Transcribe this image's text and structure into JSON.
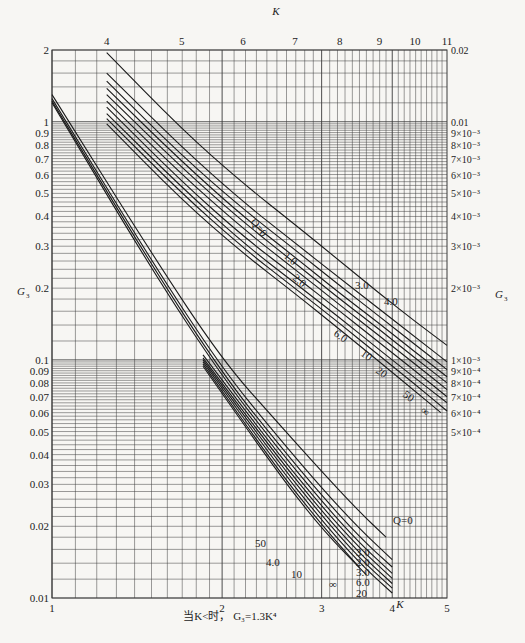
{
  "chart_data": {
    "type": "line",
    "title": "",
    "plot_area": {
      "left": 52,
      "right": 447,
      "top": 50,
      "bottom": 598
    },
    "grid": true,
    "bottom_axis": {
      "label": "K",
      "scale": "log",
      "range": [
        1,
        5
      ],
      "ticks": [
        1,
        2,
        3,
        4,
        5
      ],
      "tick_labels": [
        "1",
        "2",
        "3",
        "4",
        "5"
      ]
    },
    "top_axis": {
      "label": "K",
      "scale": "log",
      "range": [
        3.4,
        11
      ],
      "ticks": [
        4,
        5,
        6,
        7,
        8,
        9,
        10,
        11
      ],
      "tick_labels": [
        "4",
        "5",
        "6",
        "7",
        "8",
        "9",
        "10",
        "11"
      ]
    },
    "left_axis": {
      "label": "G3",
      "scale": "log",
      "range": [
        0.01,
        2
      ],
      "ticks": [
        2,
        1,
        0.9,
        0.8,
        0.7,
        0.6,
        0.5,
        0.4,
        0.3,
        0.2,
        0.1,
        0.09,
        0.08,
        0.07,
        0.06,
        0.05,
        0.04,
        0.03,
        0.02,
        0.01
      ],
      "tick_labels": [
        "2",
        "1",
        "0.9",
        "0.8",
        "0.7",
        "0.6",
        "0.5",
        "0.4",
        "0.3",
        "0.2",
        "0.1",
        "0.09",
        "0.08",
        "0.07",
        "0.06",
        "0.05",
        "0.04",
        "0.03",
        "0.02",
        "0.01"
      ]
    },
    "right_axis": {
      "label": "G3",
      "scale": "log",
      "range": [
        0.0001,
        0.02
      ],
      "ticks": [
        0.02,
        0.01,
        0.009,
        0.008,
        0.007,
        0.006,
        0.005,
        0.004,
        0.003,
        0.002,
        0.001,
        0.0009,
        0.0008,
        0.0007,
        0.0006,
        0.0005
      ],
      "tick_labels": [
        "0.02",
        "0.01",
        "9×10⁻³",
        "8×10⁻³",
        "7×10⁻³",
        "6×10⁻³",
        "5×10⁻³",
        "4×10⁻³",
        "3×10⁻³",
        "2×10⁻³",
        "1×10⁻³",
        "9×10⁻⁴",
        "8×10⁻⁴",
        "7×10⁻⁴",
        "6×10⁻⁴",
        "5×10⁻⁴"
      ]
    },
    "series_lower": {
      "axes": "bottom-left",
      "parameter": "Q",
      "series": [
        {
          "name": "Q=0",
          "points": [
            [
              1.0,
              1.3
            ],
            [
              1.5,
              0.28
            ],
            [
              2.0,
              0.1
            ],
            [
              2.5,
              0.055
            ],
            [
              3.0,
              0.034
            ],
            [
              3.5,
              0.023
            ],
            [
              3.9,
              0.018
            ]
          ]
        },
        {
          "name": "1.0",
          "points": [
            [
              1.0,
              1.25
            ],
            [
              1.5,
              0.26
            ],
            [
              2.0,
              0.092
            ],
            [
              2.5,
              0.048
            ],
            [
              3.0,
              0.029
            ],
            [
              3.5,
              0.0195
            ],
            [
              4.0,
              0.0145
            ]
          ]
        },
        {
          "name": "2.0",
          "points": [
            [
              1.0,
              1.22
            ],
            [
              1.5,
              0.25
            ],
            [
              2.0,
              0.088
            ],
            [
              2.5,
              0.045
            ],
            [
              3.0,
              0.027
            ],
            [
              3.5,
              0.018
            ],
            [
              4.0,
              0.0135
            ]
          ]
        },
        {
          "name": "3.0",
          "points": [
            [
              1.0,
              1.2
            ],
            [
              1.5,
              0.24
            ],
            [
              2.0,
              0.085
            ],
            [
              2.5,
              0.043
            ],
            [
              3.0,
              0.0255
            ],
            [
              3.5,
              0.017
            ],
            [
              4.0,
              0.0127
            ]
          ]
        },
        {
          "name": "4.0",
          "points": [
            [
              1.85,
              0.105
            ],
            [
              2.5,
              0.041
            ],
            [
              3.0,
              0.0243
            ],
            [
              3.5,
              0.0162
            ],
            [
              4.0,
              0.0121
            ]
          ]
        },
        {
          "name": "6.0",
          "points": [
            [
              1.85,
              0.102
            ],
            [
              2.5,
              0.0395
            ],
            [
              3.0,
              0.0232
            ],
            [
              3.5,
              0.0154
            ],
            [
              4.0,
              0.0115
            ]
          ]
        },
        {
          "name": "10",
          "points": [
            [
              1.85,
              0.1
            ],
            [
              2.5,
              0.038
            ],
            [
              3.0,
              0.0222
            ],
            [
              3.5,
              0.0147
            ],
            [
              4.0,
              0.011
            ]
          ]
        },
        {
          "name": "20",
          "points": [
            [
              1.85,
              0.098
            ],
            [
              2.5,
              0.0365
            ],
            [
              3.0,
              0.0212
            ],
            [
              3.5,
              0.014
            ],
            [
              4.0,
              0.0105
            ]
          ]
        },
        {
          "name": "50",
          "points": [
            [
              1.85,
              0.096
            ],
            [
              2.5,
              0.035
            ],
            [
              3.0,
              0.0203
            ],
            [
              3.5,
              0.0134
            ]
          ]
        },
        {
          "name": "∞",
          "points": [
            [
              1.85,
              0.094
            ],
            [
              2.5,
              0.034
            ],
            [
              3.0,
              0.0195
            ],
            [
              3.6,
              0.0125
            ]
          ]
        }
      ],
      "labels": [
        {
          "text": "Q=0",
          "x": 393,
          "y": 524
        },
        {
          "text": "3.0",
          "x": 356,
          "y": 556
        },
        {
          "text": "2.0",
          "x": 356,
          "y": 566
        },
        {
          "text": "3.0",
          "x": 356,
          "y": 576
        },
        {
          "text": "6.0",
          "x": 356,
          "y": 586
        },
        {
          "text": "20",
          "x": 356,
          "y": 597
        },
        {
          "text": "50",
          "x": 255,
          "y": 547
        },
        {
          "text": "4.0",
          "x": 266,
          "y": 566
        },
        {
          "text": "10",
          "x": 291,
          "y": 578
        },
        {
          "text": "∞",
          "x": 329,
          "y": 588
        }
      ]
    },
    "series_upper": {
      "axes": "top-right",
      "parameter": "Q",
      "series": [
        {
          "name": "Q=0",
          "points": [
            [
              4.0,
              0.0195
            ],
            [
              5.0,
              0.0093
            ],
            [
              6.0,
              0.0055
            ],
            [
              7.0,
              0.0037
            ],
            [
              8.0,
              0.0026
            ],
            [
              9.0,
              0.0019
            ],
            [
              10.0,
              0.00145
            ],
            [
              11.0,
              0.00115
            ]
          ]
        },
        {
          "name": "1.0",
          "points": [
            [
              4.0,
              0.016
            ],
            [
              5.0,
              0.0078
            ],
            [
              6.0,
              0.0046
            ],
            [
              7.0,
              0.0031
            ],
            [
              8.0,
              0.0022
            ],
            [
              9.0,
              0.00163
            ],
            [
              10.0,
              0.00125
            ],
            [
              11.0,
              0.00098
            ]
          ]
        },
        {
          "name": "2.0",
          "points": [
            [
              4.0,
              0.0148
            ],
            [
              5.0,
              0.0072
            ],
            [
              6.0,
              0.0043
            ],
            [
              7.0,
              0.0029
            ],
            [
              8.0,
              0.00205
            ],
            [
              9.0,
              0.00152
            ],
            [
              10.0,
              0.00116
            ],
            [
              11.0,
              0.00091
            ]
          ]
        },
        {
          "name": "3.0",
          "points": [
            [
              4.0,
              0.0138
            ],
            [
              5.0,
              0.0068
            ],
            [
              6.0,
              0.004
            ],
            [
              7.0,
              0.0027
            ],
            [
              8.0,
              0.0019
            ],
            [
              9.0,
              0.00142
            ],
            [
              10.0,
              0.00108
            ],
            [
              11.0,
              0.00085
            ]
          ]
        },
        {
          "name": "4.0",
          "points": [
            [
              4.0,
              0.013
            ],
            [
              5.0,
              0.0064
            ],
            [
              6.0,
              0.0038
            ],
            [
              7.0,
              0.00255
            ],
            [
              8.0,
              0.0018
            ],
            [
              9.0,
              0.00134
            ],
            [
              10.0,
              0.00102
            ],
            [
              11.0,
              0.0008
            ]
          ]
        },
        {
          "name": "6.0",
          "points": [
            [
              4.0,
              0.0122
            ],
            [
              5.0,
              0.006
            ],
            [
              6.0,
              0.00355
            ],
            [
              7.0,
              0.0024
            ],
            [
              8.0,
              0.0017
            ],
            [
              9.0,
              0.00126
            ],
            [
              10.0,
              0.00096
            ],
            [
              11.0,
              0.00075
            ]
          ]
        },
        {
          "name": "10",
          "points": [
            [
              4.0,
              0.0115
            ],
            [
              5.0,
              0.0056
            ],
            [
              6.0,
              0.0033
            ],
            [
              7.0,
              0.00225
            ],
            [
              8.0,
              0.0016
            ],
            [
              9.0,
              0.00118
            ],
            [
              10.0,
              0.0009
            ],
            [
              11.0,
              0.0007
            ]
          ]
        },
        {
          "name": "20",
          "points": [
            [
              4.0,
              0.0108
            ],
            [
              5.0,
              0.0053
            ],
            [
              6.0,
              0.0031
            ],
            [
              7.0,
              0.0021
            ],
            [
              8.0,
              0.0015
            ],
            [
              9.0,
              0.0011
            ],
            [
              10.0,
              0.00084
            ],
            [
              11.0,
              0.00066
            ]
          ]
        },
        {
          "name": "50",
          "points": [
            [
              4.0,
              0.0103
            ],
            [
              5.0,
              0.005
            ],
            [
              6.0,
              0.00295
            ],
            [
              7.0,
              0.002
            ],
            [
              8.0,
              0.00142
            ],
            [
              9.0,
              0.00104
            ],
            [
              10.0,
              0.00079
            ],
            [
              11.0,
              0.00061
            ]
          ]
        },
        {
          "name": "∞",
          "points": [
            [
              4.0,
              0.0098
            ],
            [
              5.0,
              0.0047
            ],
            [
              6.0,
              0.0028
            ],
            [
              7.0,
              0.0019
            ],
            [
              8.0,
              0.00134
            ],
            [
              9.0,
              0.00098
            ],
            [
              10.0,
              0.00074
            ],
            [
              10.8,
              0.0006
            ]
          ]
        }
      ],
      "labels": [
        {
          "text": "Q=0",
          "x": 250,
          "y": 222,
          "rotate": 52
        },
        {
          "text": "1.0",
          "x": 283,
          "y": 257,
          "rotate": 40
        },
        {
          "text": "2.0",
          "x": 292,
          "y": 279,
          "rotate": 40
        },
        {
          "text": "3.0",
          "x": 355,
          "y": 289
        },
        {
          "text": "4.0",
          "x": 384,
          "y": 305
        },
        {
          "text": "6.0",
          "x": 333,
          "y": 335,
          "rotate": 35
        },
        {
          "text": "10",
          "x": 360,
          "y": 355,
          "rotate": 35
        },
        {
          "text": "20",
          "x": 375,
          "y": 372,
          "rotate": 35
        },
        {
          "text": "50",
          "x": 402,
          "y": 396,
          "rotate": 35
        },
        {
          "text": "∞",
          "x": 420,
          "y": 412,
          "rotate": 35
        }
      ]
    },
    "annotations": [
      {
        "text": "当K<时，G₃=1.3K⁴",
        "position": "below bottom axis"
      }
    ]
  },
  "labels": {
    "top_axis_title": "K",
    "bottom_axis_title": "K",
    "left_axis_title": "G",
    "left_axis_title_sub": "3",
    "right_axis_title": "G",
    "right_axis_title_sub": "3",
    "footnote": "当K<时， G₃=1.3K⁴"
  },
  "colors": {
    "background": "#f7f6f3",
    "grid": "#3a3a3a",
    "curve": "#1a1a1a",
    "text": "#222222"
  }
}
